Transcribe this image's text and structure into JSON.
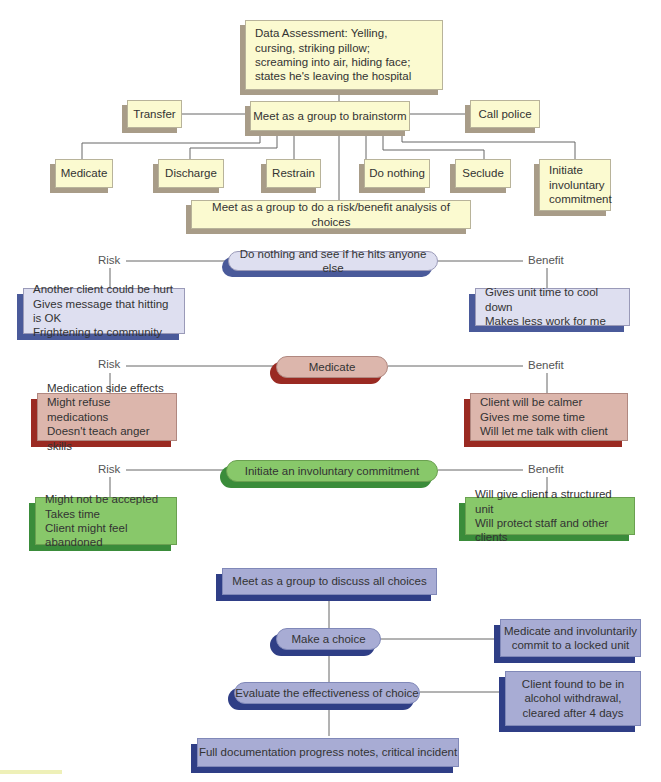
{
  "diagram": {
    "top": {
      "assessment": "Data Assessment: Yelling,\ncursing, striking pillow;\nscreaming into air, hiding face;\nstates he's leaving the hospital",
      "brainstorm": "Meet as a group to brainstorm",
      "transfer": "Transfer",
      "call_police": "Call police",
      "options": [
        "Medicate",
        "Discharge",
        "Restrain",
        "Do nothing",
        "Seclude",
        "Initiate\ninvoluntary\ncommitment"
      ],
      "risk_benefit": "Meet as a group to do a risk/benefit analysis of choices"
    },
    "analyses": [
      {
        "choice": "Do nothing and see if he hits anyone else",
        "risk_label": "Risk",
        "benefit_label": "Benefit",
        "risks": "Another client could be hurt\nGives message that hitting is OK\nFrightening to community",
        "benefits": "Gives unit time to cool down\nMakes less work for me",
        "color": "#dedff0"
      },
      {
        "choice": "Medicate",
        "risk_label": "Risk",
        "benefit_label": "Benefit",
        "risks": "Medication side effects\nMight refuse medications\nDoesn't teach anger skills",
        "benefits": "Client will be calmer\nGives me some time\nWill let me talk with client",
        "color": "#dcb6ac"
      },
      {
        "choice": "Initiate an involuntary commitment",
        "risk_label": "Risk",
        "benefit_label": "Benefit",
        "risks": "Might not be accepted\nTakes time\nClient might feel abandoned",
        "benefits": "Will give client a structured unit\nWill protect staff and other clients",
        "color": "#88c86a"
      }
    ],
    "bottom": {
      "discuss": "Meet as a group to discuss all choices",
      "make_choice": "Make a choice",
      "choice_result": "Medicate and involuntarily\ncommit to a locked unit",
      "evaluate": "Evaluate the effectiveness of choice",
      "evaluate_result": "Client found to be in\nalcohol withdrawal,\ncleared after 4 days",
      "document": "Full documentation progress notes, critical incident"
    }
  }
}
